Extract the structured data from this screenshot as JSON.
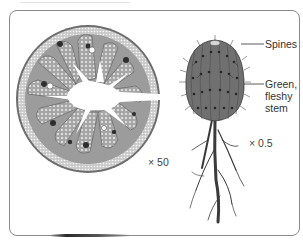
{
  "figure": {
    "cross_section": {
      "scale_label": "× 50"
    },
    "whole_plant": {
      "scale_label": "× 0.5",
      "labels": [
        {
          "text": "Spines"
        },
        {
          "text_lines": [
            "Green,",
            "fleshy",
            "stem"
          ]
        }
      ]
    }
  },
  "colors": {
    "frame": "#8a8a8a",
    "tissue_gray": "#9a9a9a",
    "dark_gray": "#4a4a4a",
    "stem_gray": "#6d6d6d",
    "root": "#3a3a3a",
    "text": "#333333"
  }
}
